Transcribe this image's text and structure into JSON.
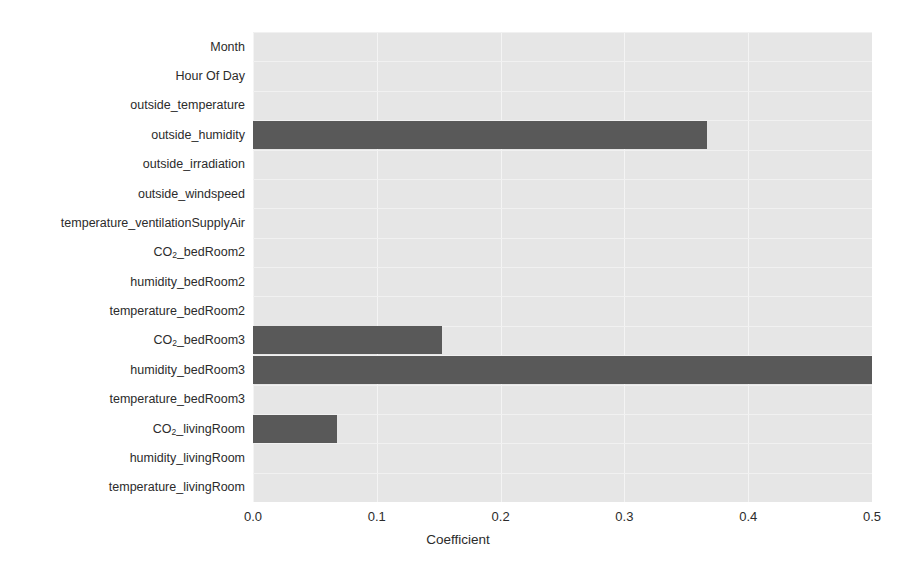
{
  "chart_data": {
    "type": "bar",
    "orientation": "horizontal",
    "title": "",
    "xlabel": "Coefficient",
    "ylabel": "",
    "xlim": [
      0.0,
      0.5
    ],
    "xticks": [
      "0.0",
      "0.1",
      "0.2",
      "0.3",
      "0.4",
      "0.5"
    ],
    "xtick_values": [
      0.0,
      0.1,
      0.2,
      0.3,
      0.4,
      0.5
    ],
    "grid": true,
    "legend": "none",
    "bar_color": "#595959",
    "plot_background": "#e6e6e6",
    "gridline_color": "#f4f4f4",
    "categories": [
      "Month",
      "Hour Of Day",
      "outside_temperature",
      "outside_humidity",
      "outside_irradiation",
      "outside_windspeed",
      "temperature_ventilationSupplyAir",
      "CO₂_bedRoom2",
      "humidity_bedRoom2",
      "temperature_bedRoom2",
      "CO₂_bedRoom3",
      "humidity_bedRoom3",
      "temperature_bedRoom3",
      "CO₂_livingRoom",
      "humidity_livingRoom",
      "temperature_livingRoom"
    ],
    "values": [
      0.0,
      0.0,
      0.0,
      0.367,
      0.0,
      0.0,
      0.0,
      0.0,
      0.0,
      0.0,
      0.153,
      0.5,
      0.0,
      0.068,
      0.0,
      0.0
    ],
    "category_labels_html": [
      "Month",
      "Hour Of Day",
      "outside_temperature",
      "outside_humidity",
      "outside_irradiation",
      "outside_windspeed",
      "temperature_ventilationSupplyAir",
      "CO<sub>2</sub>_bedRoom2",
      "humidity_bedRoom2",
      "temperature_bedRoom2",
      "CO<sub>2</sub>_bedRoom3",
      "humidity_bedRoom3",
      "temperature_bedRoom3",
      "CO<sub>2</sub>_livingRoom",
      "humidity_livingRoom",
      "temperature_livingRoom"
    ]
  }
}
